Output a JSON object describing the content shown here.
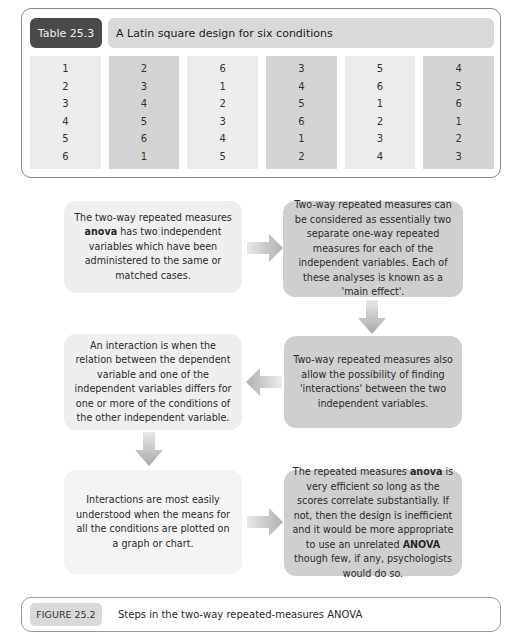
{
  "table": {
    "label": "Table 25.3",
    "title": "A Latin square design for six conditions",
    "columns": [
      [
        "1",
        "2",
        "3",
        "4",
        "5",
        "6"
      ],
      [
        "2",
        "3",
        "4",
        "5",
        "6",
        "1"
      ],
      [
        "6",
        "1",
        "2",
        "3",
        "4",
        "5"
      ],
      [
        "3",
        "4",
        "5",
        "6",
        "1",
        "2"
      ],
      [
        "5",
        "6",
        "1",
        "2",
        "3",
        "4"
      ],
      [
        "4",
        "5",
        "6",
        "1",
        "2",
        "3"
      ]
    ]
  },
  "flow": {
    "box1": {
      "pre": "The two-way repeated measures ",
      "bold": "anova",
      "post": " has two independent variables which have been administered to the same or matched cases."
    },
    "box2": {
      "text": "Two-way repeated measures can be considered as essentially two separate one-way repeated measures for each of the independent variables. Each of these analyses is known as a 'main effect'."
    },
    "box3": {
      "text": "Two-way repeated measures also allow the possibility of finding 'interactions' between the two independent variables."
    },
    "box4": {
      "text": "An interaction is when the relation between the dependent variable and one of the independent variables differs for one or more of the conditions of the other independent variable."
    },
    "box5": {
      "text": "Interactions are most easily understood when the means for all the conditions are plotted on a graph or chart."
    },
    "box6": {
      "pre": "The repeated measures ",
      "bold1": "anova",
      "mid": " is very efficient so long as the scores correlate substantially. If not, then the design is inefficient and it would be more appropriate to use an unrelated ",
      "bold2": "ANOVA",
      "post": " though few, if any, psychologists would do so."
    },
    "arrows": [
      "right",
      "down",
      "left",
      "down",
      "right"
    ]
  },
  "figure": {
    "label": "FIGURE 25.2",
    "title": "Steps in the two-way repeated-measures ANOVA"
  },
  "colors": {
    "label_dark": "#4a4a4a",
    "title_bar": "#d9d9d9",
    "box_light": "#efefef",
    "box_dark": "#cfcfcf",
    "arrow": "#b5b5b5"
  }
}
